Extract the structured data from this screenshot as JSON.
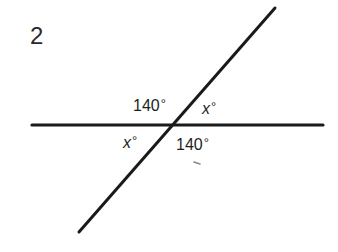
{
  "problem": {
    "number": "2"
  },
  "figure": {
    "line_color": "#1a1a1a",
    "background_color": "#ffffff",
    "horizontal_line": {
      "x1": 32,
      "y1": 125,
      "x2": 323,
      "y2": 125
    },
    "diagonal_line": {
      "x1": 275,
      "y1": 8,
      "x2": 79,
      "y2": 232
    },
    "intersection": {
      "x": 171,
      "y": 125
    }
  },
  "angles": {
    "upper_left": {
      "value": "140",
      "degree": "°"
    },
    "upper_right": {
      "variable": "x",
      "degree": "°"
    },
    "lower_left": {
      "variable": "x",
      "degree": "°"
    },
    "lower_right": {
      "value": "140",
      "degree": "°"
    }
  }
}
